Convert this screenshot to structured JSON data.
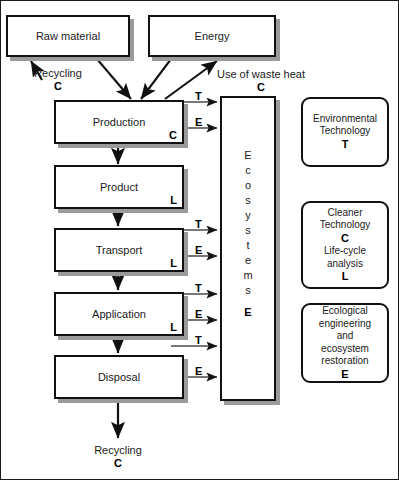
{
  "figure": {
    "width": 399,
    "height": 480,
    "colors": {
      "stroke": "#111111",
      "shadow": "#9a9a9a",
      "text": "#1a1a1a",
      "background": "#ffffff"
    }
  },
  "inputs": {
    "raw_material": "Raw material",
    "energy": "Energy"
  },
  "chain": [
    {
      "label": "Production",
      "code": "C"
    },
    {
      "label": "Product",
      "code": "L"
    },
    {
      "label": "Transport",
      "code": "L"
    },
    {
      "label": "Application",
      "code": "L"
    },
    {
      "label": "Disposal",
      "code": ""
    }
  ],
  "ecosystems": {
    "letters": [
      "E",
      "c",
      "o",
      "s",
      "y",
      "s",
      "t",
      "e",
      "m",
      "s"
    ],
    "code": "E"
  },
  "captions": {
    "recycling_top": {
      "text": "Recycling",
      "code": "C"
    },
    "waste_heat": {
      "text": "Use of waste heat",
      "code": "C"
    },
    "recycling_bottom": {
      "text": "Recycling",
      "code": "C"
    }
  },
  "flow_labels": {
    "production_t": "T",
    "production_e": "E",
    "transport_t": "T",
    "transport_e": "E",
    "application_t": "T",
    "application_e": "E",
    "application_t2": "T",
    "disposal_e": "E"
  },
  "legend": [
    {
      "lines": [
        "Environmental",
        "Technology"
      ],
      "codes": [
        "T"
      ],
      "full": "Environmental Technology — T"
    },
    {
      "lines": [
        "Cleaner",
        "Technology"
      ],
      "codes": [
        "C"
      ],
      "lines2": [
        "Life-cycle",
        "analysis"
      ],
      "codes2": [
        "L"
      ],
      "full": "Cleaner Technology — C; Life-cycle analysis — L"
    },
    {
      "lines": [
        "Ecological",
        "engineering",
        "and",
        "ecosystem",
        "restoration"
      ],
      "codes": [
        "E"
      ],
      "full": "Ecological engineering and ecosystem restoration — E"
    }
  ]
}
